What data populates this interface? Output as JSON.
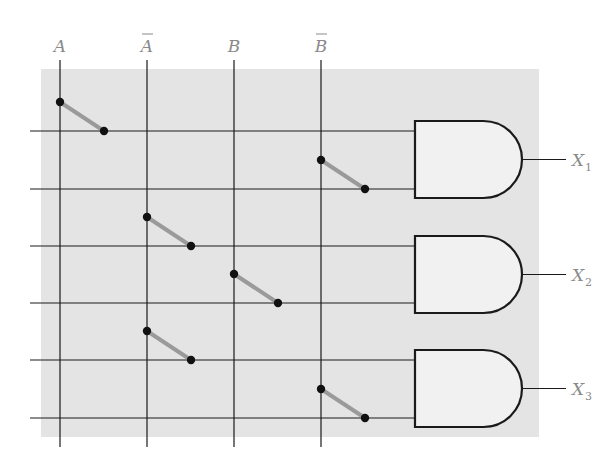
{
  "diagram": {
    "type": "PLA / programmable AND array with fusible links",
    "colors": {
      "background": "#ffffff",
      "array_fill": "#e4e4e4",
      "wire": "#1a1a1a",
      "gate_fill": "#f1f1f1",
      "fuse": "#9a9a9a",
      "label": "#8a8a8a"
    },
    "inputs": [
      {
        "id": "A",
        "label": "A",
        "overbar": false,
        "x": 60
      },
      {
        "id": "A_bar",
        "label": "A",
        "overbar": true,
        "x": 147
      },
      {
        "id": "B",
        "label": "B",
        "overbar": false,
        "x": 234
      },
      {
        "id": "B_bar",
        "label": "B",
        "overbar": true,
        "x": 321
      }
    ],
    "rows": [
      131,
      189,
      246,
      303,
      360,
      418
    ],
    "gates": [
      {
        "id": "gate1",
        "type": "AND",
        "output": "X",
        "subscript": "1",
        "in_rows": [
          0,
          1
        ],
        "top": 121,
        "bottom": 198
      },
      {
        "id": "gate2",
        "type": "AND",
        "output": "X",
        "subscript": "2",
        "in_rows": [
          2,
          3
        ],
        "top": 236,
        "bottom": 313
      },
      {
        "id": "gate3",
        "type": "AND",
        "output": "X",
        "subscript": "3",
        "in_rows": [
          4,
          5
        ],
        "top": 350,
        "bottom": 427
      }
    ],
    "fuses": [
      {
        "input": "A",
        "row": 0
      },
      {
        "input": "B_bar",
        "row": 1
      },
      {
        "input": "A_bar",
        "row": 2
      },
      {
        "input": "B",
        "row": 3
      },
      {
        "input": "A_bar",
        "row": 4
      },
      {
        "input": "B_bar",
        "row": 5
      }
    ]
  }
}
